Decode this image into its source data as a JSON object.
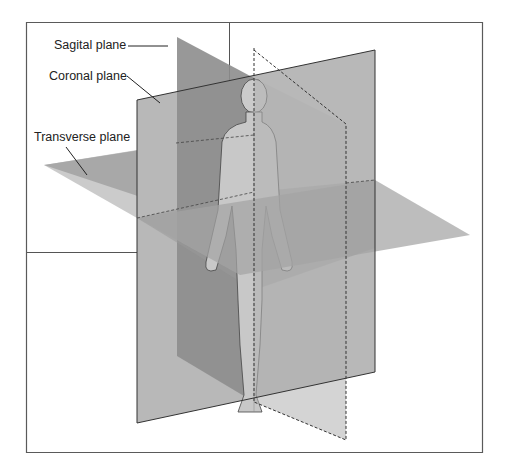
{
  "figure": {
    "labels": {
      "sagital": "Sagital plane",
      "coronal": "Coronal plane",
      "transverse": "Transverse plane"
    }
  },
  "colors": {
    "background": "#ffffff",
    "frame": "#555555",
    "sagital_plane": "#8f8f8f",
    "coronal_plane": "#b3b3b3",
    "transverse_plane": "#a6a6a6",
    "body": "#c9c9c9",
    "outline": "#333333"
  }
}
